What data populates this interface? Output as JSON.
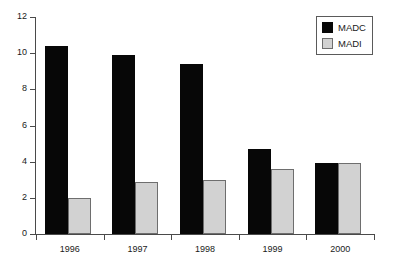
{
  "chart_data": {
    "type": "bar",
    "title": "",
    "subtitle": "",
    "xlabel": "",
    "ylabel": "",
    "categories": [
      "1996",
      "1997",
      "1998",
      "1999",
      "2000"
    ],
    "series": [
      {
        "name": "MADC",
        "color": "#070707",
        "values": [
          10.4,
          9.9,
          9.4,
          4.7,
          3.9
        ]
      },
      {
        "name": "MADI",
        "color": "#d2d2d2",
        "values": [
          2.0,
          2.9,
          3.0,
          3.6,
          3.95
        ]
      }
    ],
    "ylim": [
      0,
      12
    ],
    "ytick_labels": [
      "0",
      "2",
      "4",
      "6",
      "8",
      "10",
      "12"
    ],
    "ytick_values": [
      0,
      2,
      4,
      6,
      8,
      10,
      12
    ],
    "grid": false,
    "legend_position": "top-right",
    "legend_entries": [
      "MADC",
      "MADI"
    ]
  },
  "legend": {
    "items": [
      {
        "label": "MADC",
        "swatch": "black-square-swatch"
      },
      {
        "label": "MADI",
        "swatch": "gray-square-swatch"
      }
    ]
  }
}
